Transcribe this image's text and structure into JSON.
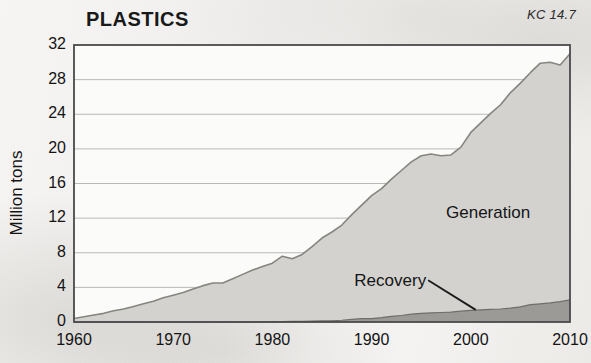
{
  "chart_data": {
    "type": "area",
    "title": "PLASTICS",
    "code_label": "KC 14.7",
    "xlabel": "",
    "ylabel": "Million tons",
    "xlim": [
      1960,
      2010
    ],
    "ylim": [
      0,
      32
    ],
    "grid": true,
    "stacked": true,
    "legend_position": "inside-plot",
    "x_ticks": [
      1960,
      1970,
      1980,
      1990,
      2000,
      2010
    ],
    "y_ticks": [
      0,
      4,
      8,
      12,
      16,
      20,
      24,
      28,
      32
    ],
    "annotations": [
      {
        "text": "Generation",
        "x": 1997.5,
        "y": 12.5
      },
      {
        "text": "Recovery",
        "x": 1995.5,
        "y": 4.6,
        "leader_to_x": 2000.5,
        "leader_to_y": 1.4
      }
    ],
    "x": [
      1960,
      1961,
      1962,
      1963,
      1964,
      1965,
      1966,
      1967,
      1968,
      1969,
      1970,
      1971,
      1972,
      1973,
      1974,
      1975,
      1976,
      1977,
      1978,
      1979,
      1980,
      1981,
      1982,
      1983,
      1984,
      1985,
      1986,
      1987,
      1988,
      1989,
      1990,
      1991,
      1992,
      1993,
      1994,
      1995,
      1996,
      1997,
      1998,
      1999,
      2000,
      2001,
      2002,
      2003,
      2004,
      2005,
      2006,
      2007,
      2008,
      2009,
      2010
    ],
    "series": [
      {
        "name": "Generation",
        "color": "#d3d2cf",
        "values": [
          0.4,
          0.6,
          0.8,
          1.0,
          1.3,
          1.5,
          1.8,
          2.1,
          2.4,
          2.8,
          3.1,
          3.4,
          3.8,
          4.2,
          4.5,
          4.5,
          5.0,
          5.5,
          6.0,
          6.4,
          6.8,
          7.6,
          7.3,
          7.8,
          8.7,
          9.7,
          10.4,
          11.2,
          12.4,
          13.5,
          14.6,
          15.4,
          16.5,
          17.5,
          18.5,
          19.2,
          19.4,
          19.2,
          19.3,
          20.2,
          21.9,
          23.0,
          24.1,
          25.1,
          26.5,
          27.6,
          28.8,
          29.9,
          30.0,
          29.7,
          31.0
        ]
      },
      {
        "name": "Recovery",
        "color": "#9b9a97",
        "values": [
          0.0,
          0.0,
          0.0,
          0.0,
          0.0,
          0.0,
          0.0,
          0.0,
          0.0,
          0.0,
          0.0,
          0.0,
          0.0,
          0.0,
          0.0,
          0.0,
          0.0,
          0.0,
          0.0,
          0.0,
          0.05,
          0.06,
          0.07,
          0.08,
          0.1,
          0.12,
          0.14,
          0.2,
          0.3,
          0.4,
          0.4,
          0.5,
          0.65,
          0.75,
          0.9,
          1.0,
          1.05,
          1.1,
          1.15,
          1.25,
          1.35,
          1.4,
          1.45,
          1.5,
          1.6,
          1.75,
          2.0,
          2.1,
          2.2,
          2.35,
          2.55
        ]
      }
    ]
  },
  "plot_geometry": {
    "left": 74,
    "right": 570,
    "top": 45,
    "bottom": 322
  },
  "axis": {
    "y_tick_labels": [
      "32",
      "28",
      "24",
      "20",
      "16",
      "12",
      "8",
      "4",
      "0"
    ],
    "x_tick_labels": [
      "1960",
      "1970",
      "1980",
      "1990",
      "2000",
      "2010"
    ]
  },
  "colors": {
    "generation_fill": "#d3d2cf",
    "recovery_fill": "#9b9a97",
    "plot_border": "#4a4a4c",
    "gridline": "#b9b8b5",
    "text": "#141415",
    "paper": "#f2f1ef"
  }
}
